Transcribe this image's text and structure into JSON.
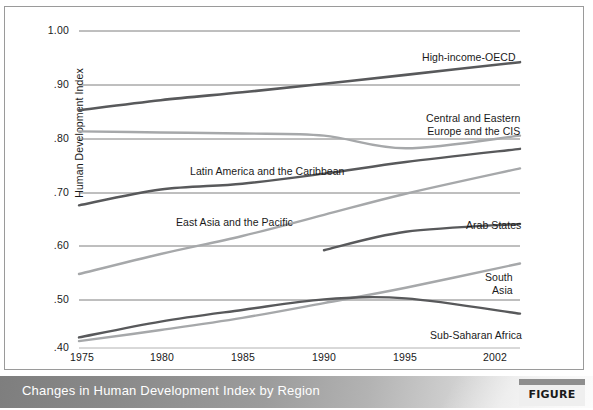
{
  "figure": {
    "caption": "Changes in Human Development Index by Region",
    "figure_number": "FIGURE 1.2"
  },
  "chart_data": {
    "type": "line",
    "title": "Changes in Human Development Index by Region",
    "xlabel": "",
    "ylabel": "Human Development Index",
    "x": [
      1975,
      1980,
      1985,
      1990,
      1995,
      2002
    ],
    "xlim": [
      1975,
      2002
    ],
    "ylim": [
      0.4,
      1.0
    ],
    "ytick_labels": [
      "1.00",
      ".90",
      ".80",
      ".70",
      ".60",
      ".50",
      ".40"
    ],
    "ytick_values": [
      1.0,
      0.9,
      0.8,
      0.7,
      0.6,
      0.5,
      0.4
    ],
    "xtick_labels": [
      "1975",
      "1980",
      "1985",
      "1990",
      "1995",
      "2002"
    ],
    "grid": "horizontal",
    "legend": "inline-labels",
    "series": [
      {
        "name": "High-income-OECD",
        "color": "#58595b",
        "width": 2.6,
        "label_x": 417,
        "label_y": 44,
        "x": [
          1975,
          1980,
          1985,
          1990,
          1995,
          2002
        ],
        "values": [
          0.85,
          0.869,
          0.884,
          0.9,
          0.917,
          0.941
        ]
      },
      {
        "name": "Central and Eastern Europe and the CIS",
        "color": "#a6a8aa",
        "width": 2.4,
        "label_x": 421,
        "label_y": 105,
        "label_lines": [
          "Central and Eastern",
          "Europe and the CIS"
        ],
        "x": [
          1975,
          1980,
          1985,
          1990,
          1995,
          2002
        ],
        "values": [
          0.81,
          0.808,
          0.806,
          0.802,
          0.778,
          0.802
        ]
      },
      {
        "name": "Latin America and the Caribbean",
        "color": "#58595b",
        "width": 2.4,
        "label_x": 185,
        "label_y": 158,
        "x": [
          1975,
          1980,
          1985,
          1990,
          1995,
          2002
        ],
        "values": [
          0.67,
          0.7,
          0.711,
          0.73,
          0.752,
          0.777
        ]
      },
      {
        "name": "East Asia and the Pacific",
        "color": "#a6a8aa",
        "width": 2.4,
        "label_x": 171,
        "label_y": 209,
        "x": [
          1975,
          1980,
          1985,
          1990,
          1995,
          2002
        ],
        "values": [
          0.54,
          0.578,
          0.612,
          0.652,
          0.692,
          0.74
        ]
      },
      {
        "name": "Arab States",
        "color": "#58595b",
        "width": 2.4,
        "label_x": 461,
        "label_y": 212,
        "x": [
          1990,
          1995,
          2002
        ],
        "values": [
          0.585,
          0.62,
          0.635
        ]
      },
      {
        "name": "South Asia",
        "color": "#a6a8aa",
        "width": 2.4,
        "label_x": 480,
        "label_y": 264,
        "label_lines": [
          "South",
          "Asia"
        ],
        "x": [
          1975,
          1980,
          1985,
          1990,
          1995,
          2002
        ],
        "values": [
          0.413,
          0.434,
          0.457,
          0.485,
          0.514,
          0.56
        ]
      },
      {
        "name": "Sub-Saharan Africa",
        "color": "#58595b",
        "width": 2.4,
        "label_x": 425,
        "label_y": 322,
        "x": [
          1975,
          1980,
          1985,
          1990,
          1995,
          2002
        ],
        "values": [
          0.42,
          0.45,
          0.472,
          0.492,
          0.494,
          0.465
        ]
      }
    ]
  },
  "axis": {
    "y_title": "Human Development Index",
    "yticks": [
      {
        "label": "1.00",
        "y": 24
      },
      {
        "label": ".90",
        "y": 78
      },
      {
        "label": ".80",
        "y": 132
      },
      {
        "label": ".70",
        "y": 186
      },
      {
        "label": ".60",
        "y": 239
      },
      {
        "label": ".50",
        "y": 293
      },
      {
        "label": ".40",
        "y": 341
      }
    ],
    "xticks": [
      {
        "label": "1975",
        "x": 77
      },
      {
        "label": "1980",
        "x": 157
      },
      {
        "label": "1985",
        "x": 238
      },
      {
        "label": "1990",
        "x": 319
      },
      {
        "label": "1995",
        "x": 400
      },
      {
        "label": "2002",
        "x": 490
      }
    ]
  }
}
